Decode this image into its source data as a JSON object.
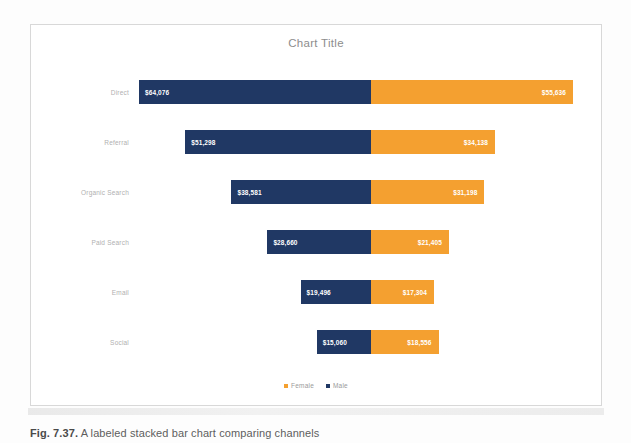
{
  "card": {
    "title": "Chart Title"
  },
  "caption": {
    "label": "Fig. 7.37.",
    "text": " A labeled stacked bar chart comparing channels"
  },
  "colors": {
    "male": "#203864",
    "female": "#F4A030",
    "card_border": "#d8d8d8",
    "title_text": "#8d8d8d",
    "category_text": "#b0b0b0",
    "legend_text": "#9a9a9a"
  },
  "legend": {
    "position": "bottom",
    "items": [
      {
        "label": "Female",
        "color": "#F4A030",
        "name": "legend-item-female"
      },
      {
        "label": "Male",
        "color": "#203864",
        "name": "legend-item-male"
      }
    ]
  },
  "chart_data": {
    "type": "bar",
    "orientation": "horizontal",
    "stacked": true,
    "title": "Chart Title",
    "xlabel": "",
    "ylabel": "",
    "grid": false,
    "legend_position": "bottom",
    "axis_ticks_visible": false,
    "categories": [
      "Direct",
      "Referral",
      "Organic Search",
      "Paid Search",
      "Email",
      "Social"
    ],
    "series": [
      {
        "name": "Male",
        "color": "#203864",
        "values": [
          64076,
          51298,
          38581,
          28660,
          19496,
          15060
        ],
        "labels": [
          "$64,076",
          "$51,298",
          "$38,581",
          "$28,660",
          "$19,496",
          "$15,060"
        ]
      },
      {
        "name": "Female",
        "color": "#F4A030",
        "values": [
          55636,
          34138,
          31198,
          21405,
          17304,
          18556
        ],
        "labels": [
          "$55,636",
          "$34,138",
          "$31,198",
          "$21,405",
          "$17,304",
          "$18,556"
        ]
      }
    ],
    "totals": [
      119712,
      85436,
      69779,
      50065,
      36800,
      33616
    ],
    "xlim": [
      0,
      119712
    ]
  },
  "rows": [
    {
      "category": "Direct",
      "male_label": "$64,076",
      "female_label": "$55,636",
      "male_value": 64076,
      "female_value": 55636
    },
    {
      "category": "Referral",
      "male_label": "$51,298",
      "female_label": "$34,138",
      "male_value": 51298,
      "female_value": 34138
    },
    {
      "category": "Organic Search",
      "male_label": "$38,581",
      "female_label": "$31,198",
      "male_value": 38581,
      "female_value": 31198
    },
    {
      "category": "Paid Search",
      "male_label": "$28,660",
      "female_label": "$21,405",
      "male_value": 28660,
      "female_value": 21405
    },
    {
      "category": "Email",
      "male_label": "$19,496",
      "female_label": "$17,304",
      "male_value": 19496,
      "female_value": 17304
    },
    {
      "category": "Social",
      "male_label": "$15,060",
      "female_label": "$18,556",
      "male_value": 15060,
      "female_value": 18556
    }
  ]
}
